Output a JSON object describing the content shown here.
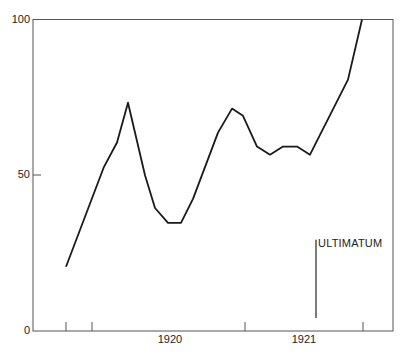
{
  "chart_data": {
    "type": "line",
    "title": "",
    "xlabel": "",
    "ylabel": "",
    "ylim": [
      0,
      100
    ],
    "yticks": [
      0,
      50,
      100
    ],
    "ytick_labels": [
      "0",
      "50",
      "100"
    ],
    "xtick_labels": [
      "1920",
      "1921"
    ],
    "grid": false,
    "legend": null,
    "series": [
      {
        "name": "index",
        "points": [
          {
            "x": 66,
            "y": 20.6
          },
          {
            "x": 104,
            "y": 52.7
          },
          {
            "x": 117,
            "y": 60.5
          },
          {
            "x": 128,
            "y": 73.3
          },
          {
            "x": 145,
            "y": 50.0
          },
          {
            "x": 155,
            "y": 39.5
          },
          {
            "x": 168,
            "y": 34.7
          },
          {
            "x": 181,
            "y": 34.7
          },
          {
            "x": 193,
            "y": 42.4
          },
          {
            "x": 218,
            "y": 63.7
          },
          {
            "x": 232,
            "y": 71.4
          },
          {
            "x": 243,
            "y": 69.1
          },
          {
            "x": 257,
            "y": 59.2
          },
          {
            "x": 270,
            "y": 56.6
          },
          {
            "x": 283,
            "y": 59.2
          },
          {
            "x": 297,
            "y": 59.2
          },
          {
            "x": 310,
            "y": 56.6
          },
          {
            "x": 348,
            "y": 80.7
          },
          {
            "x": 362,
            "y": 100
          }
        ]
      }
    ],
    "annotations": [
      {
        "text": "ULTIMATUM",
        "x": 316,
        "y_from": 4.2,
        "y_to": 29.3
      }
    ]
  },
  "labels": {
    "y0": "0",
    "y50": "50",
    "y100": "100",
    "x1920": "1920",
    "x1921": "1921",
    "ultimatum": "ULTIMATUM"
  }
}
